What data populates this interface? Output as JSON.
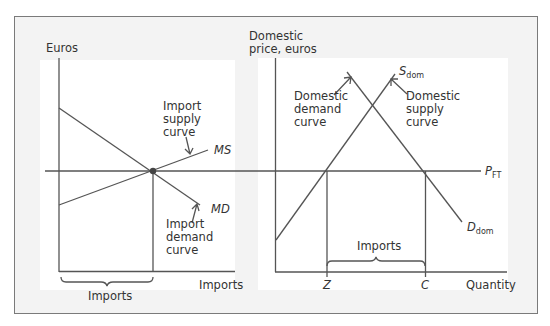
{
  "left_panel": {
    "y_axis_label": "Euros",
    "x_axis_label": "Imports",
    "bracket_label": "Imports",
    "supply_annotation": [
      "Import",
      "supply",
      "curve"
    ],
    "demand_annotation": [
      "Import",
      "demand",
      "curve"
    ],
    "supply_curve_label": "MS",
    "demand_curve_label": "MD"
  },
  "right_panel": {
    "y_axis_label": [
      "Domestic",
      "price, euros"
    ],
    "x_axis_label": "Quantity",
    "bracket_label": "Imports",
    "demand_annotation": [
      "Domestic",
      "demand",
      "curve"
    ],
    "supply_annotation": [
      "Domestic",
      "supply",
      "curve"
    ],
    "supply_curve_label": {
      "main": "S",
      "sub": "dom"
    },
    "demand_curve_label": {
      "main": "D",
      "sub": "dom"
    },
    "price_line_label": {
      "main": "P",
      "sub": "FT"
    },
    "x_ticks": [
      "Z",
      "C"
    ]
  },
  "colors": {
    "line": "#555555",
    "frame_bg": "#f3f3f3",
    "panel_bg": "#ffffff",
    "text": "#333333"
  }
}
